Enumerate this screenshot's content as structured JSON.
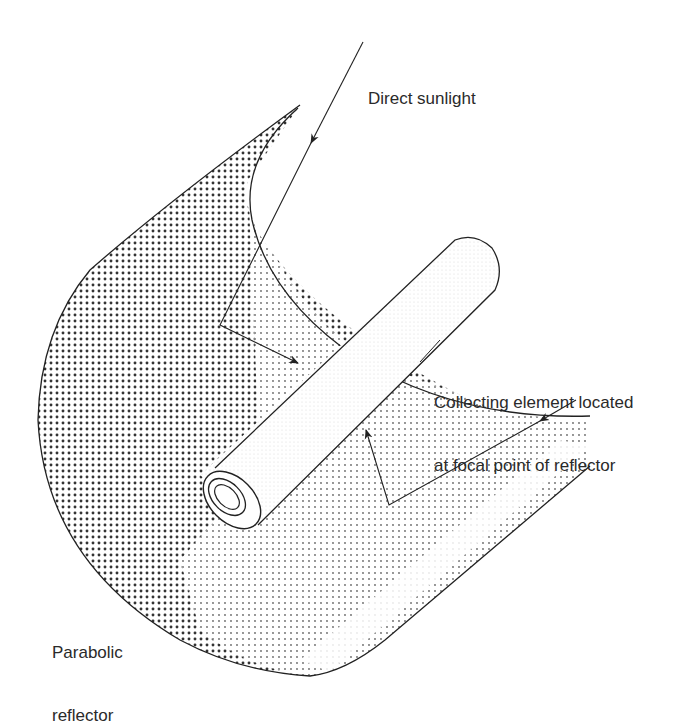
{
  "figure": {
    "labels": {
      "direct_sunlight": "Direct sunlight",
      "collecting_element_line1": "Collecting element located",
      "collecting_element_line2": "at focal point of reflector",
      "parabolic_reflector_line1": "Parabolic",
      "parabolic_reflector_line2": "reflector"
    },
    "components": [
      {
        "id": "parabolic-reflector",
        "name": "Parabolic reflector",
        "shading": "dot-stipple"
      },
      {
        "id": "collecting-element",
        "name": "Collecting element (tube)",
        "shading": "light"
      },
      {
        "id": "sun-ray-1",
        "name": "Incoming direct sunlight ray, reflected to tube"
      },
      {
        "id": "sun-ray-2",
        "name": "Second incoming ray, reflected to tube"
      }
    ],
    "colors": {
      "line": "#222222",
      "background": "#ffffff",
      "dot_dark": "#333333",
      "dot_light": "#777777"
    }
  }
}
